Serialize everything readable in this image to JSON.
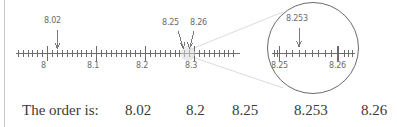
{
  "figure": {
    "main_number_line": {
      "name": "main-number-line",
      "range_start": 8.0,
      "range_end": 8.3,
      "major_ticks": [
        {
          "value": "8",
          "label": "8"
        },
        {
          "value": "8.1",
          "label": "8.1"
        },
        {
          "value": "8.2",
          "label": "8.2"
        },
        {
          "value": "8.3",
          "label": "8.3"
        }
      ],
      "minor_tick_step": 0.01,
      "annotations": [
        {
          "label": "8.02",
          "value": 8.02
        },
        {
          "label": "8.25",
          "value": 8.25
        },
        {
          "label": "8.26",
          "value": 8.26
        }
      ]
    },
    "magnifier": {
      "name": "magnified-detail-circle",
      "range_start": 8.25,
      "range_end": 8.26,
      "end_labels": [
        "8.25",
        "8.26"
      ],
      "minor_tick_step": 0.001,
      "annotations": [
        {
          "label": "8.253",
          "value": 8.253
        }
      ]
    }
  },
  "order": {
    "caption": "The order is:",
    "values": [
      "8.02",
      "8.2",
      "8.25",
      "8.253",
      "8.26"
    ]
  },
  "colors": {
    "ink": "#6b6b6b",
    "text": "#3a3a3a",
    "rule": "#c9c9c9",
    "leader": "#cfcfcf"
  }
}
